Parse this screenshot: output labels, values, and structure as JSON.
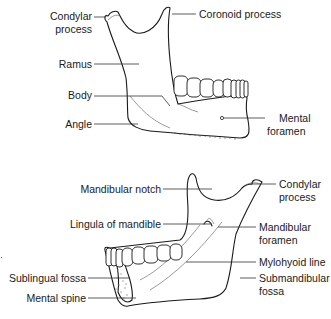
{
  "figure": {
    "top_view": {
      "title": "Lateral view of mandible",
      "labels": {
        "condylar_process_1": "Condylar",
        "condylar_process_2": "process",
        "coronoid_process": "Coronoid process",
        "ramus": "Ramus",
        "body": "Body",
        "angle": "Angle",
        "mental_foramen_1": "Mental",
        "mental_foramen_2": "foramen"
      }
    },
    "bottom_view": {
      "title": "Medial view of mandible",
      "labels": {
        "mandibular_notch": "Mandibular notch",
        "condylar_process_1": "Condylar",
        "condylar_process_2": "process",
        "lingula": "Lingula of mandible",
        "mandibular_foramen_1": "Mandibular",
        "mandibular_foramen_2": "foramen",
        "mylohyoid_line": "Mylohyoid line",
        "sublingual_fossa": "Sublingual fossa",
        "submandibular_fossa_1": "Submandibular",
        "submandibular_fossa_2": "fossa",
        "mental_spine": "Mental spine"
      }
    },
    "colors": {
      "line": "#1a1a1a",
      "background": "#ffffff"
    }
  }
}
